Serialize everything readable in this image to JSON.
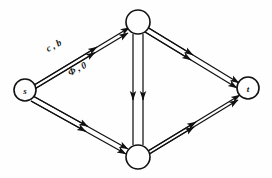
{
  "diagram": {
    "kind": "flow-network-graph",
    "background_color": "#fefefe",
    "stroke_color": "#111111",
    "nodes": [
      {
        "id": "s",
        "label": "s",
        "x": 25,
        "y": 90,
        "r": 11,
        "has_label": true
      },
      {
        "id": "top",
        "label": "",
        "x": 138,
        "y": 22,
        "r": 12,
        "has_label": false
      },
      {
        "id": "bottom",
        "label": "",
        "x": 138,
        "y": 157,
        "r": 12,
        "has_label": false
      },
      {
        "id": "t",
        "label": "t",
        "x": 248,
        "y": 88,
        "r": 11,
        "has_label": true
      }
    ],
    "edges": [
      {
        "id": "s-top-upper",
        "from": "s",
        "to": "top",
        "direction": "forward",
        "arrow": "up-right"
      },
      {
        "id": "s-top-lower",
        "from": "s",
        "to": "top",
        "direction": "forward",
        "arrow": "up-right"
      },
      {
        "id": "top-t-upper",
        "from": "top",
        "to": "t",
        "direction": "forward",
        "arrow": "down-right"
      },
      {
        "id": "top-t-lower",
        "from": "top",
        "to": "t",
        "direction": "forward",
        "arrow": "down-right"
      },
      {
        "id": "s-bottom-upper",
        "from": "s",
        "to": "bottom",
        "direction": "forward",
        "arrow": "down-right"
      },
      {
        "id": "s-bottom-lower",
        "from": "s",
        "to": "bottom",
        "direction": "forward",
        "arrow": "down-right"
      },
      {
        "id": "bottom-t-upper",
        "from": "bottom",
        "to": "t",
        "direction": "forward",
        "arrow": "up-right"
      },
      {
        "id": "bottom-t-lower",
        "from": "bottom",
        "to": "t",
        "direction": "forward",
        "arrow": "up-right"
      },
      {
        "id": "top-bottom-left",
        "from": "top",
        "to": "bottom",
        "direction": "forward",
        "arrow": "down"
      },
      {
        "id": "top-bottom-right",
        "from": "top",
        "to": "bottom",
        "direction": "forward",
        "arrow": "down"
      }
    ],
    "edge_labels": [
      {
        "id": "label-capacity-bound",
        "text": "c , b",
        "x": 48,
        "y": 52
      },
      {
        "id": "label-flow-zero",
        "text": "Φ , 0",
        "x": 70,
        "y": 76
      }
    ]
  }
}
